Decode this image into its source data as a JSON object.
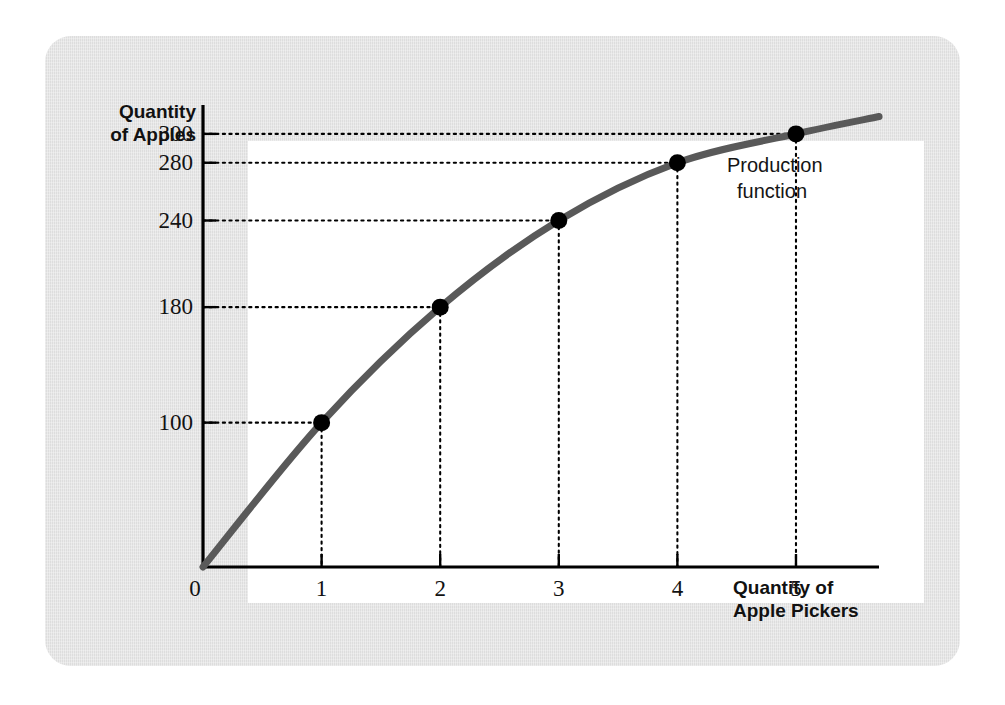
{
  "figure": {
    "curve_label_line1": "Production",
    "curve_label_line2": "function",
    "y_axis_title_line1": "Quantity",
    "y_axis_title_line2": "of Apples",
    "x_axis_title_line1": "Quantity of",
    "x_axis_title_line2": "Apple Pickers",
    "colors": {
      "card_background": "#e4e4e4",
      "plot_background": "#ffffff",
      "axis": "#000000",
      "curve": "#595959",
      "marker": "#000000",
      "guide_line": "#000000",
      "text": "#111111"
    }
  },
  "chart_data": {
    "type": "line",
    "title": "",
    "subtitle": "",
    "xlabel": "Quantity of Apple Pickers",
    "ylabel": "Quantity of Apples",
    "grid": false,
    "legend_position": "inline-end-of-curve",
    "annotations": [
      {
        "text": "Production function",
        "target": "curve-end"
      }
    ],
    "xlim": [
      0,
      5.7
    ],
    "ylim": [
      0,
      320
    ],
    "x_tick_labels": [
      "0",
      "1",
      "2",
      "3",
      "4",
      "5"
    ],
    "x_ticks": [
      0,
      1,
      2,
      3,
      4,
      5
    ],
    "y_tick_labels": [
      "100",
      "180",
      "240",
      "280",
      "300"
    ],
    "y_ticks": [
      100,
      180,
      240,
      280,
      300
    ],
    "series": [
      {
        "name": "Production function",
        "x": [
          0,
          1,
          2,
          3,
          4,
          5
        ],
        "values": [
          0,
          100,
          180,
          240,
          280,
          300
        ],
        "markers_at": [
          1,
          2,
          3,
          4,
          5
        ]
      }
    ],
    "points": [
      {
        "x": 1,
        "y": 100,
        "x_label": "1",
        "y_label": "100"
      },
      {
        "x": 2,
        "y": 180,
        "x_label": "2",
        "y_label": "180"
      },
      {
        "x": 3,
        "y": 240,
        "x_label": "3",
        "y_label": "240"
      },
      {
        "x": 4,
        "y": 280,
        "x_label": "4",
        "y_label": "280"
      },
      {
        "x": 5,
        "y": 300,
        "x_label": "5",
        "y_label": "300"
      }
    ]
  }
}
